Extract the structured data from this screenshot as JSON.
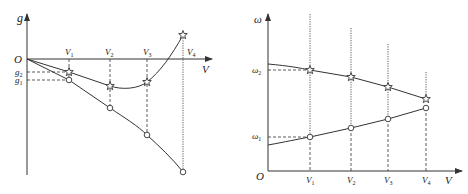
{
  "left_chart": {
    "y_axis_label": "g",
    "x_axis_label": "V",
    "origin_label": "O",
    "y_tick_labels": [
      {
        "base": "g",
        "sub": "2"
      },
      {
        "base": "g",
        "sub": "1"
      }
    ],
    "x_tick_labels": [
      {
        "base": "V",
        "sub": "1"
      },
      {
        "base": "V",
        "sub": "2"
      },
      {
        "base": "V",
        "sub": "3"
      },
      {
        "base": "V",
        "sub": "4"
      }
    ],
    "series": [
      {
        "name": "star-curve",
        "marker": "star"
      },
      {
        "name": "circle-curve",
        "marker": "circle"
      }
    ]
  },
  "right_chart": {
    "y_axis_label": "ω",
    "x_axis_label": "V",
    "origin_label": "O",
    "y_tick_labels": [
      {
        "base": "ω",
        "sub": "2"
      },
      {
        "base": "ω",
        "sub": "1"
      }
    ],
    "x_tick_labels": [
      {
        "base": "V",
        "sub": "1"
      },
      {
        "base": "V",
        "sub": "2"
      },
      {
        "base": "V",
        "sub": "3"
      },
      {
        "base": "V",
        "sub": "4"
      }
    ],
    "series": [
      {
        "name": "star-curve",
        "marker": "star"
      },
      {
        "name": "circle-curve",
        "marker": "circle"
      }
    ]
  },
  "colors": {
    "line": "#333333",
    "background": "#ffffff"
  }
}
